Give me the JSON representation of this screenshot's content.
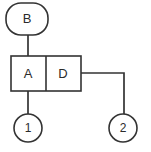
{
  "diagram": {
    "type": "node-link-diagram",
    "canvas": {
      "width": 151,
      "height": 152,
      "background": "#ffffff"
    },
    "stroke_color": "#333333",
    "fill_color": "#ffffff",
    "text_color": "#2b2b2b",
    "nodes": [
      {
        "id": "B",
        "label": "B",
        "shape": "rounded-rectangle",
        "x": 6,
        "y": 3,
        "width": 42,
        "height": 32,
        "center_x": 27,
        "center_y": 19,
        "corner_radius": 15
      },
      {
        "id": "AD",
        "label": "",
        "shape": "split-rectangle",
        "x": 11,
        "y": 56,
        "width": 70,
        "height": 35,
        "divider_x": 46,
        "cells": [
          {
            "id": "A",
            "label": "A",
            "center_x": 28,
            "center_y": 74
          },
          {
            "id": "D",
            "label": "D",
            "center_x": 63,
            "center_y": 74
          }
        ]
      },
      {
        "id": "one",
        "label": "1",
        "shape": "circle",
        "center_x": 28,
        "center_y": 128,
        "radius": 14
      },
      {
        "id": "two",
        "label": "2",
        "shape": "circle",
        "center_x": 123,
        "center_y": 128,
        "radius": 14
      }
    ],
    "edges": [
      {
        "id": "edge-b-to-a",
        "from": "B",
        "to": "A",
        "path": "M 28 35 L 28 56"
      },
      {
        "id": "edge-a-to-one",
        "from": "A",
        "to": "one",
        "path": "M 28 91 L 28 114"
      },
      {
        "id": "edge-d-to-two",
        "from": "D",
        "to": "two",
        "path": "M 81 73 L 124 73 L 124 114"
      }
    ]
  }
}
